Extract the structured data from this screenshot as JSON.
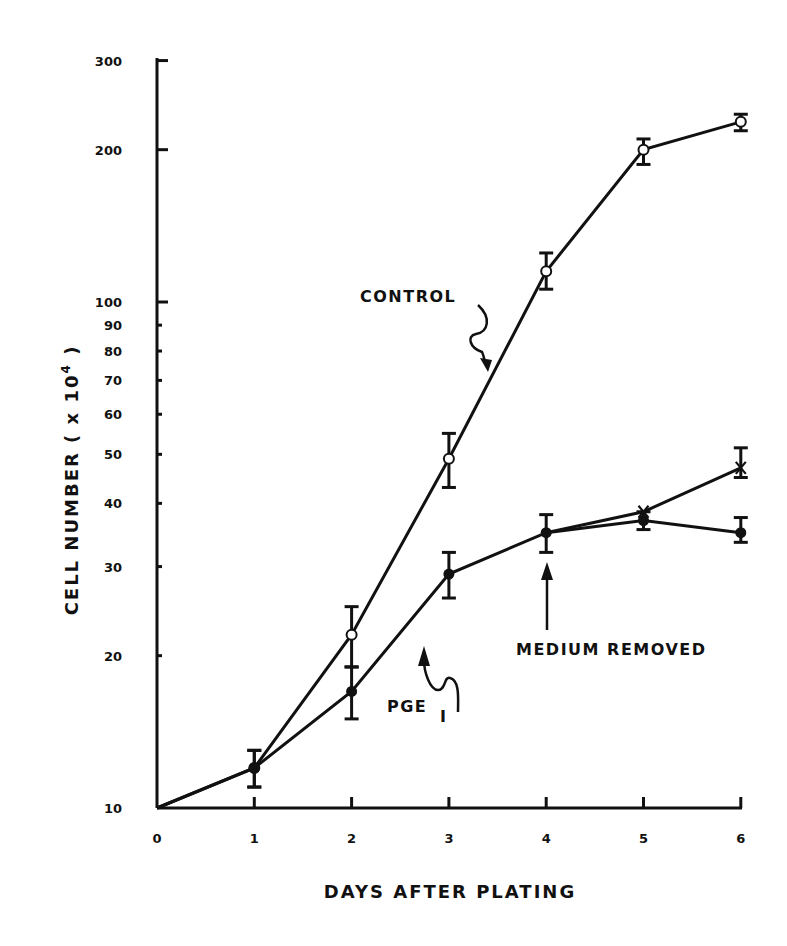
{
  "chart_data": {
    "type": "line",
    "title": "",
    "xlabel": "DAYS AFTER PLATING",
    "ylabel": "CELL NUMBER ( x10⁴ )",
    "yscale": "log",
    "xlim": [
      0,
      6
    ],
    "ylim": [
      10,
      300
    ],
    "x_ticks": [
      0,
      1,
      2,
      3,
      4,
      5,
      6
    ],
    "y_ticks": [
      10,
      20,
      30,
      40,
      50,
      60,
      70,
      80,
      90,
      100,
      200,
      300
    ],
    "y_tick_labels": [
      "10",
      "20",
      "30",
      "40",
      "50",
      "60",
      "70",
      "80",
      "90",
      "100",
      "200",
      "300"
    ],
    "grid": false,
    "series": [
      {
        "name": "CONTROL",
        "marker": "open-circle",
        "x": [
          0,
          1,
          2,
          3,
          4,
          5,
          6
        ],
        "values": [
          10,
          12,
          22,
          49,
          115,
          200,
          227
        ],
        "err_low": [
          null,
          11,
          19,
          43,
          106,
          187,
          218
        ],
        "err_high": [
          null,
          13,
          25,
          55,
          125,
          210,
          235
        ]
      },
      {
        "name": "PGE1",
        "marker": "filled-circle",
        "x": [
          0,
          1,
          2,
          3,
          4,
          5,
          6
        ],
        "values": [
          10,
          12,
          17,
          29,
          35,
          37,
          35
        ],
        "err_low": [
          null,
          11,
          15,
          26,
          32,
          35.5,
          33.5
        ],
        "err_high": [
          null,
          13,
          19,
          32,
          38,
          38.5,
          37.5
        ]
      },
      {
        "name": "PGE1 - MEDIUM REMOVED",
        "marker": "x",
        "x": [
          4,
          5,
          6
        ],
        "values": [
          35,
          38.5,
          47
        ],
        "err_low": [
          null,
          null,
          45
        ],
        "err_high": [
          null,
          null,
          51.5
        ]
      }
    ],
    "annotations": [
      {
        "text": "CONTROL",
        "points_to": "CONTROL series near day 3.3"
      },
      {
        "text": "PGE",
        "subscript": "1",
        "points_to": "PGE1 series near day 2.8"
      },
      {
        "text": "MEDIUM REMOVED",
        "points_to": "day 4"
      }
    ]
  },
  "labels": {
    "x_axis_title": "DAYS AFTER PLATING",
    "y_axis_title_main": "CELL NUMBER  (  x 10",
    "y_axis_title_sup": "4",
    "y_axis_title_end": " )",
    "control": "CONTROL",
    "pge": "PGE",
    "pge_sub": "I",
    "medium_removed": "MEDIUM  REMOVED"
  },
  "colors": {
    "ink": "#111111",
    "background": "#ffffff"
  }
}
